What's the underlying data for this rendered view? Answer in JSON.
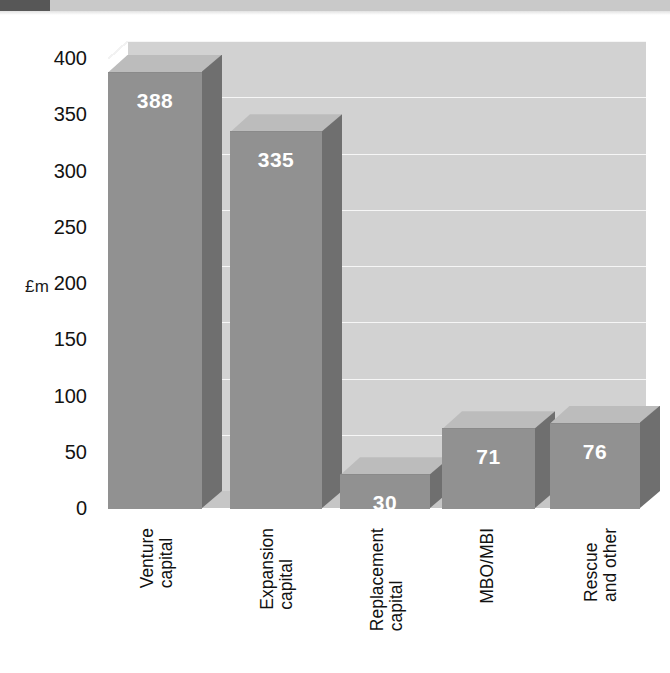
{
  "page": {
    "background": "#ffffff",
    "scan_strip_dark_color": "#575757",
    "scan_strip_light_color": "#c9c9c9"
  },
  "chart_data": {
    "type": "bar",
    "title": "",
    "subtitle": "",
    "xlabel": "",
    "ylabel": "£m",
    "ylim": [
      0,
      400
    ],
    "ytick_labels": [
      "400",
      "350",
      "300",
      "250",
      "200",
      "150",
      "100",
      "50",
      "0"
    ],
    "ytick_values": [
      400,
      350,
      300,
      250,
      200,
      150,
      100,
      50,
      0
    ],
    "grid": true,
    "grid_orientation": "horizontal",
    "legend": "none",
    "three_d": true,
    "categories": [
      "Venture capital",
      "Expansion capital",
      "Replacement capital",
      "MBO/MBI",
      "Rescue and other"
    ],
    "category_lines": [
      [
        "Venture",
        "capital"
      ],
      [
        "Expansion",
        "capital"
      ],
      [
        "Replacement",
        "capital"
      ],
      [
        "MBO/MBI"
      ],
      [
        "Rescue",
        "and other"
      ]
    ],
    "values": [
      388,
      335,
      30,
      71,
      76
    ],
    "data_labels": [
      "388",
      "335",
      "30",
      "71",
      "76"
    ],
    "colors": {
      "bar_front": "#919191",
      "bar_side": "#6f6f6f",
      "bar_top": "#bcbcbc",
      "plot_background": "#d2d2d2",
      "floor": "#c6c6c6",
      "gridline": "#f4f4f4",
      "data_label_text": "#ffffff",
      "tick_text": "#131313"
    }
  }
}
